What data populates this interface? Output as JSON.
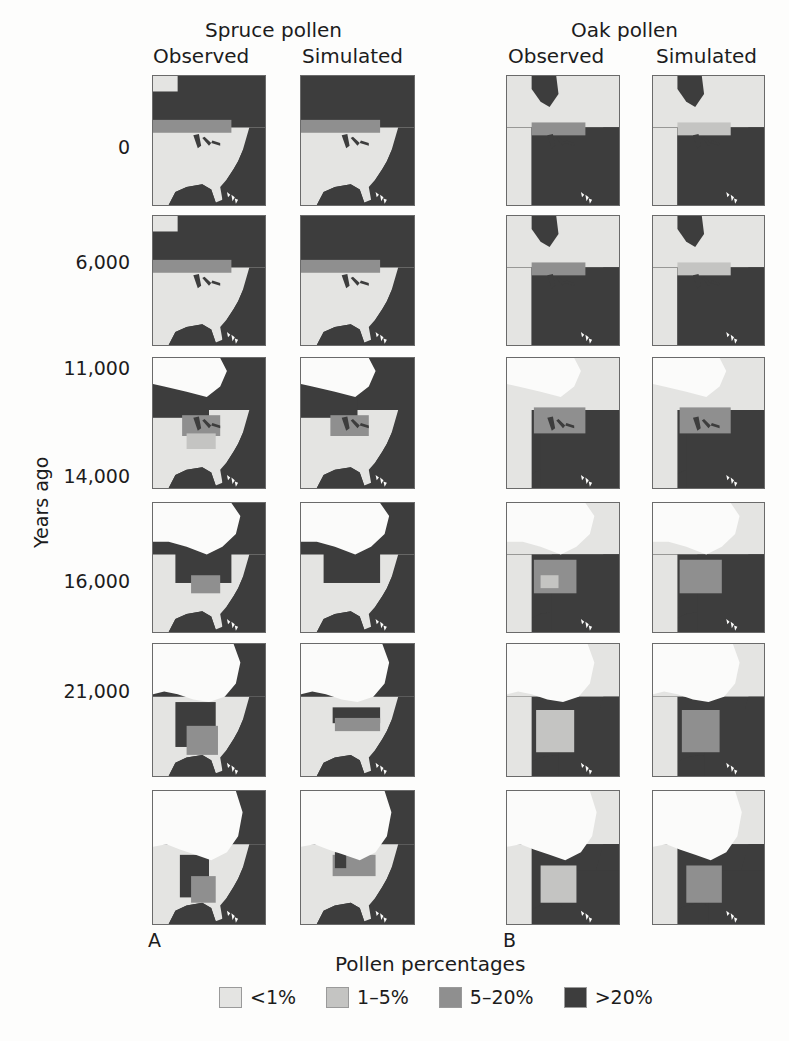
{
  "figure": {
    "groups": [
      {
        "title": "Spruce pollen",
        "letter": "A",
        "columns": [
          "Observed",
          "Simulated"
        ]
      },
      {
        "title": "Oak pollen",
        "letter": "B",
        "columns": [
          "Observed",
          "Simulated"
        ]
      }
    ],
    "y_axis_label": "Years ago",
    "rows": [
      "0",
      "6,000",
      "11,000",
      "14,000",
      "16,000",
      "21,000"
    ],
    "legend": {
      "title": "Pollen percentages",
      "items": [
        {
          "label": "<1%",
          "color": "#e4e4e2"
        },
        {
          "label": "1–5%",
          "color": "#c4c4c2"
        },
        {
          "label": "5–20%",
          "color": "#8f8f8f"
        },
        {
          "label": ">20%",
          "color": "#3d3d3d"
        }
      ]
    }
  },
  "chart_data": {
    "type": "heatmap",
    "panels": [
      "A: Spruce pollen",
      "B: Oak pollen"
    ],
    "columns": [
      "Spruce Observed",
      "Spruce Simulated",
      "Oak Observed",
      "Oak Simulated"
    ],
    "rows_years_ago": [
      0,
      6000,
      11000,
      14000,
      16000,
      21000
    ],
    "categories": [
      "<1%",
      "1–5%",
      "5–20%",
      ">20%"
    ],
    "ylabel": "Years ago",
    "legend_title": "Pollen percentages",
    "legend_position": "bottom"
  }
}
